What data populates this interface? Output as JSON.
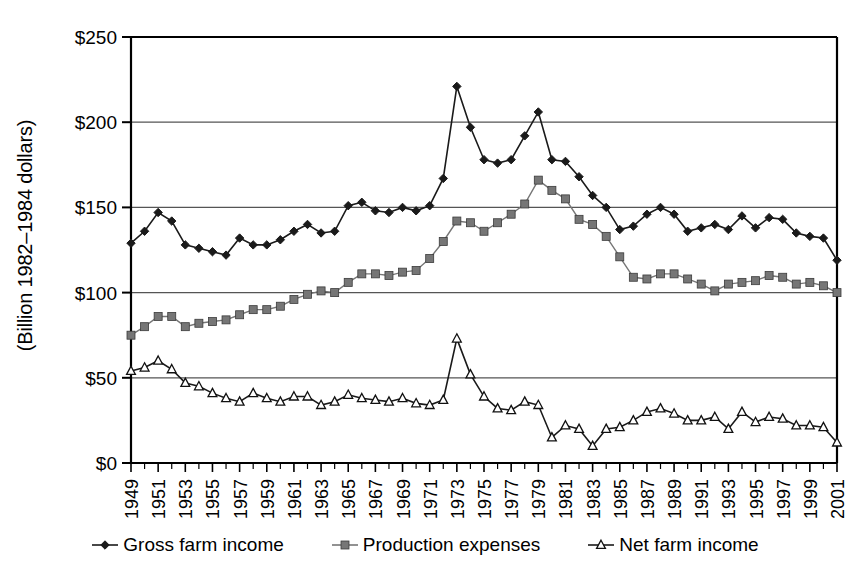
{
  "chart_data": {
    "type": "line",
    "title": "",
    "xlabel": "",
    "ylabel": "(Billion 1982–1984 dollars)",
    "ylim": [
      0,
      250
    ],
    "ytick_labels": [
      "$0",
      "$50",
      "$100",
      "$150",
      "$200",
      "$250"
    ],
    "ytick_values": [
      0,
      50,
      100,
      150,
      200,
      250
    ],
    "grid": "horizontal",
    "legend_position": "bottom",
    "x": [
      1949,
      1950,
      1951,
      1952,
      1953,
      1954,
      1955,
      1956,
      1957,
      1958,
      1959,
      1960,
      1961,
      1962,
      1963,
      1964,
      1965,
      1966,
      1967,
      1968,
      1969,
      1970,
      1971,
      1972,
      1973,
      1974,
      1975,
      1976,
      1977,
      1978,
      1979,
      1980,
      1981,
      1982,
      1983,
      1984,
      1985,
      1986,
      1987,
      1988,
      1989,
      1990,
      1991,
      1992,
      1993,
      1994,
      1995,
      1996,
      1997,
      1998,
      1999,
      2000,
      2001
    ],
    "xtick_labels": [
      "1949",
      "1951",
      "1953",
      "1955",
      "1957",
      "1959",
      "1961",
      "1963",
      "1965",
      "1967",
      "1969",
      "1971",
      "1973",
      "1975",
      "1977",
      "1979",
      "1981",
      "1983",
      "1985",
      "1987",
      "1989",
      "1991",
      "1993",
      "1995",
      "1997",
      "1999",
      "2001"
    ],
    "xtick_values": [
      1949,
      1951,
      1953,
      1955,
      1957,
      1959,
      1961,
      1963,
      1965,
      1967,
      1969,
      1971,
      1973,
      1975,
      1977,
      1979,
      1981,
      1983,
      1985,
      1987,
      1989,
      1991,
      1993,
      1995,
      1997,
      1999,
      2001
    ],
    "series": [
      {
        "name": "Gross farm income",
        "marker": "diamond",
        "color": "#1a1a1a",
        "values": [
          129,
          136,
          147,
          142,
          128,
          126,
          124,
          122,
          132,
          128,
          128,
          131,
          136,
          140,
          135,
          136,
          151,
          153,
          148,
          147,
          150,
          148,
          151,
          167,
          221,
          197,
          178,
          176,
          178,
          192,
          206,
          178,
          177,
          168,
          157,
          150,
          137,
          139,
          146,
          150,
          146,
          136,
          138,
          140,
          137,
          145,
          138,
          144,
          143,
          135,
          133,
          132,
          119
        ]
      },
      {
        "name": "Production expenses",
        "marker": "square",
        "color": "#767676",
        "values": [
          75,
          80,
          86,
          86,
          80,
          82,
          83,
          84,
          87,
          90,
          90,
          92,
          96,
          99,
          101,
          100,
          106,
          111,
          111,
          110,
          112,
          113,
          120,
          130,
          142,
          141,
          136,
          141,
          146,
          152,
          166,
          160,
          155,
          143,
          140,
          133,
          121,
          109,
          108,
          111,
          111,
          108,
          105,
          101,
          105,
          106,
          107,
          110,
          109,
          105,
          106,
          104,
          100
        ]
      },
      {
        "name": "Net farm income",
        "marker": "triangle",
        "color": "#1a1a1a",
        "values": [
          54,
          56,
          60,
          55,
          47,
          45,
          41,
          38,
          36,
          41,
          38,
          36,
          39,
          39,
          34,
          36,
          40,
          38,
          37,
          36,
          38,
          35,
          34,
          37,
          73,
          52,
          39,
          32,
          31,
          36,
          34,
          15,
          22,
          20,
          10,
          20,
          21,
          25,
          30,
          32,
          29,
          25,
          25,
          27,
          20,
          30,
          24,
          27,
          26,
          22,
          22,
          21,
          12
        ]
      }
    ]
  },
  "legend": {
    "items": [
      {
        "label": "Gross farm income",
        "marker": "diamond"
      },
      {
        "label": "Production expenses",
        "marker": "square"
      },
      {
        "label": "Net farm income",
        "marker": "triangle"
      }
    ]
  }
}
